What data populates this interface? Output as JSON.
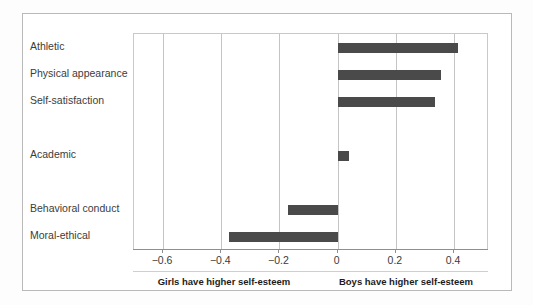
{
  "chart_data": {
    "type": "bar",
    "orientation": "horizontal",
    "title": "",
    "subtitle": "",
    "xlabel": "",
    "ylabel": "",
    "categories": [
      "Athletic",
      "Physical appearance",
      "Self-satisfaction",
      "Academic",
      "Behavioral conduct",
      "Moral-ethical"
    ],
    "values": [
      0.415,
      0.355,
      0.335,
      0.04,
      -0.17,
      -0.375
    ],
    "xlim": [
      -0.7,
      0.52
    ],
    "ylim": [
      0,
      6
    ],
    "xticks": [
      -0.6,
      -0.4,
      -0.2,
      0,
      0.2,
      0.4
    ],
    "xticklabels": [
      "−0.6",
      "−0.4",
      "−0.2",
      "0",
      "0.2",
      "0.4"
    ],
    "grid": true,
    "grid_axis": "x",
    "legend": false,
    "legend_position": "none",
    "bar_color": "#4a4a4a",
    "zero_reference": 0,
    "annotations": [
      {
        "text": "Girls have higher self-esteem",
        "side": "left"
      },
      {
        "text": "Boys have higher self-esteem",
        "side": "right"
      }
    ],
    "row_layout": [
      {
        "category": "Athletic",
        "value": 0.415,
        "row": 0
      },
      {
        "category": "Physical appearance",
        "value": 0.355,
        "row": 1
      },
      {
        "category": "Self-satisfaction",
        "value": 0.335,
        "row": 2
      },
      {
        "category": "Academic",
        "value": 0.04,
        "row": 4
      },
      {
        "category": "Behavioral conduct",
        "value": -0.17,
        "row": 6
      },
      {
        "category": "Moral-ethical",
        "value": -0.375,
        "row": 7
      }
    ]
  },
  "footer": {
    "left_caption": "Girls have higher self-esteem",
    "right_caption": "Boys have higher self-esteem"
  },
  "colors": {
    "bar": "#4a4a4a",
    "grid": "#c4c4c4",
    "axis": "#8f8f8f",
    "frame": "#b9b9b9",
    "text": "#3c3c3c",
    "background": "#ffffff"
  }
}
